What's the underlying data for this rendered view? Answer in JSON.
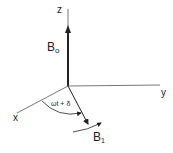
{
  "diagram": {
    "axes": {
      "z_label": "z",
      "y_label": "y",
      "x_label": "x"
    },
    "vectors": {
      "b0_main": "B",
      "b0_sub": "o",
      "b1_main": "B",
      "b1_sub": "1"
    },
    "angle_label": "ωt + δ",
    "colors": {
      "stroke": "#222222",
      "background": "#ffffff"
    }
  }
}
